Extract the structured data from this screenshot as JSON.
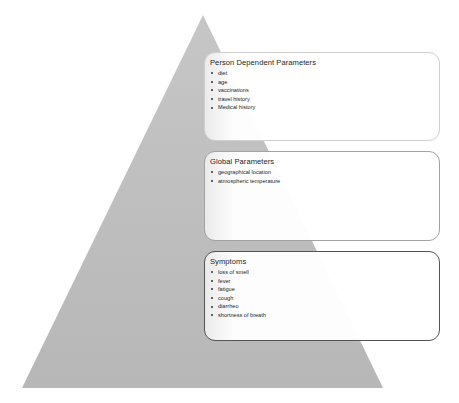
{
  "diagram": {
    "type": "pyramid",
    "colors": {
      "pyramid_fill": "#b9b9b9",
      "box_top_border": "#cfcfcf",
      "box_mid_border": "#a2a2a2",
      "box_bot_border": "#555555",
      "text": "#1e1e1e"
    },
    "boxes": [
      {
        "title": "Person Dependent Parameters",
        "items": [
          "diet",
          "age",
          "vaccinations",
          "travel history",
          "Medical history"
        ]
      },
      {
        "title": "Global Parameters",
        "items": [
          "geographical location",
          "atmospheric temperature"
        ]
      },
      {
        "title": "Symptoms",
        "items": [
          "loss of smell",
          "fever",
          "fatigue",
          "cough",
          "diarrheo",
          "shortness of breath"
        ]
      }
    ]
  }
}
